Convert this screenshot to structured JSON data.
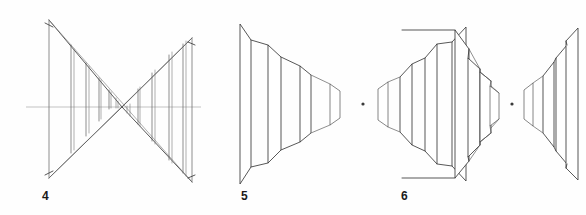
{
  "sheet": {
    "background_color": "#fefefe",
    "ink_color": "#3a3a3a",
    "axis_color": "#8a8a8a",
    "label_color": "#1a1a1a",
    "width": 586,
    "height": 215
  },
  "figures": [
    {
      "id": "figure-4",
      "label": "4",
      "label_x": 42,
      "label_y": 190,
      "caption": "Bowtie / double-cone perspective of nested square frames through a vanishing point",
      "has_center_axis": true,
      "center_axis_y": 107,
      "center_axis_x1": 26,
      "center_axis_x2": 200,
      "vanishing_point_x": 122,
      "vanishing_point_y": 107,
      "left_apex": {
        "x": 49,
        "y": 20
      },
      "left_base_bottom": {
        "x": 49,
        "y": 178
      },
      "right_apex_top": {
        "x": 192,
        "y": 38
      },
      "right_apex_bottom": {
        "x": 192,
        "y": 182
      },
      "frame_count_left": 7,
      "frame_count_right": 7
    },
    {
      "id": "figure-5",
      "label": "5",
      "label_x": 241,
      "label_y": 190,
      "caption": "Opposing stacks of trapezoid panels converging on a central point",
      "has_center_axis": false,
      "center_dot_x": 363,
      "center_dot_y": 104,
      "panel_count_left": 4,
      "panel_count_right": 4
    },
    {
      "id": "figure-6",
      "label": "6",
      "label_x": 401,
      "label_y": 190,
      "caption": "Opposing stacks of trapezoid panels with large flat-faced back panel at left",
      "has_center_axis": false,
      "center_dot_x": 512,
      "center_dot_y": 104,
      "panel_count_left": 4,
      "panel_count_right": 4,
      "has_back_face_lines": true
    }
  ],
  "icons": {
    "center_dot": "center-point-dot",
    "axis_line": "horizontal-axis-line"
  }
}
